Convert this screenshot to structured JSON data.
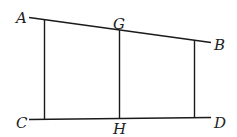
{
  "diagram": {
    "type": "geometry",
    "width": 237,
    "height": 137,
    "colors": {
      "line": "#1a1a1a",
      "label": "#222222",
      "background": "#ffffff"
    },
    "points": {
      "A": {
        "label": "A",
        "x": 29,
        "y": 17
      },
      "B": {
        "label": "B",
        "x": 211,
        "y": 42
      },
      "C": {
        "label": "C",
        "x": 29,
        "y": 119
      },
      "D": {
        "label": "D",
        "x": 211,
        "y": 117
      },
      "G": {
        "label": "G",
        "x": 119,
        "y": 30
      },
      "H": {
        "label": "H",
        "x": 119,
        "y": 118
      }
    },
    "labels": {
      "A": "A",
      "B": "B",
      "C": "C",
      "D": "D",
      "G": "G",
      "H": "H"
    },
    "segments": [
      {
        "name": "AB",
        "from": "A",
        "to": "B"
      },
      {
        "name": "CD",
        "from": "C",
        "to": "D"
      },
      {
        "name": "left-vertical",
        "x": 44
      },
      {
        "name": "GH",
        "from": "G",
        "to": "H"
      },
      {
        "name": "right-vertical",
        "x": 194
      }
    ]
  }
}
